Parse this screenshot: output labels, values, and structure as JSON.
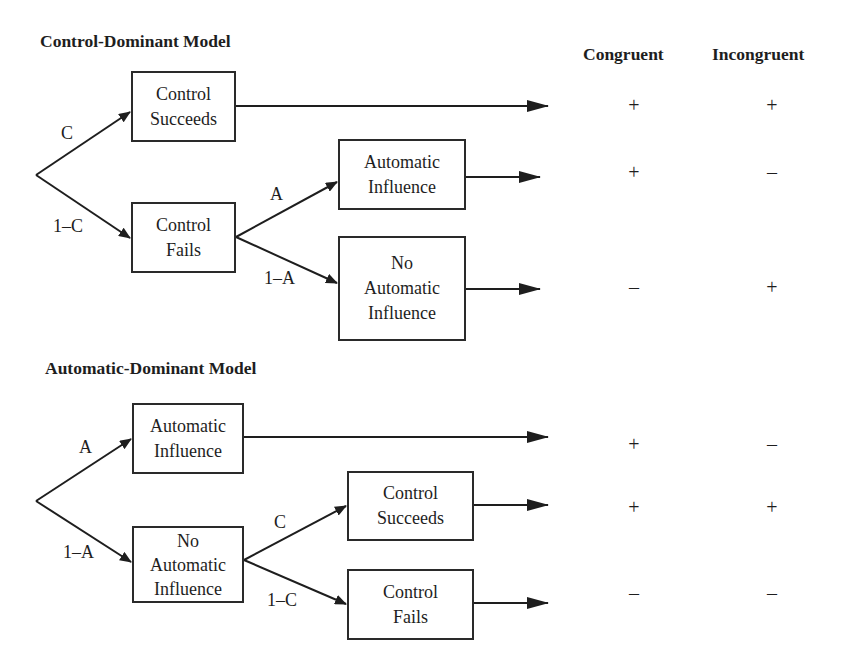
{
  "columns": {
    "congruent": "Congruent",
    "incongruent": "Incongruent"
  },
  "control_dominant": {
    "title": "Control-Dominant Model",
    "branches": {
      "c": "C",
      "one_minus_c": "1–C",
      "a": "A",
      "one_minus_a": "1–A"
    },
    "boxes": {
      "control_succeeds": [
        "Control",
        "Succeeds"
      ],
      "control_fails": [
        "Control",
        "Fails"
      ],
      "automatic_influence": [
        "Automatic",
        "Influence"
      ],
      "no_automatic_influence": [
        "No",
        "Automatic",
        "Influence"
      ]
    },
    "outcomes": [
      {
        "path": "Control Succeeds",
        "congruent": "+",
        "incongruent": "+"
      },
      {
        "path": "Control Fails → Automatic Influence",
        "congruent": "+",
        "incongruent": "–"
      },
      {
        "path": "Control Fails → No Automatic Influence",
        "congruent": "–",
        "incongruent": "+"
      }
    ]
  },
  "automatic_dominant": {
    "title": "Automatic-Dominant Model",
    "branches": {
      "a": "A",
      "one_minus_a": "1–A",
      "c": "C",
      "one_minus_c": "1–C"
    },
    "boxes": {
      "automatic_influence": [
        "Automatic",
        "Influence"
      ],
      "no_automatic_influence": [
        "No",
        "Automatic",
        "Influence"
      ],
      "control_succeeds": [
        "Control",
        "Succeeds"
      ],
      "control_fails": [
        "Control",
        "Fails"
      ]
    },
    "outcomes": [
      {
        "path": "Automatic Influence",
        "congruent": "+",
        "incongruent": "–"
      },
      {
        "path": "No Automatic Influence → Control Succeeds",
        "congruent": "+",
        "incongruent": "+"
      },
      {
        "path": "No Automatic Influence → Control Fails",
        "congruent": "–",
        "incongruent": "–"
      }
    ]
  }
}
